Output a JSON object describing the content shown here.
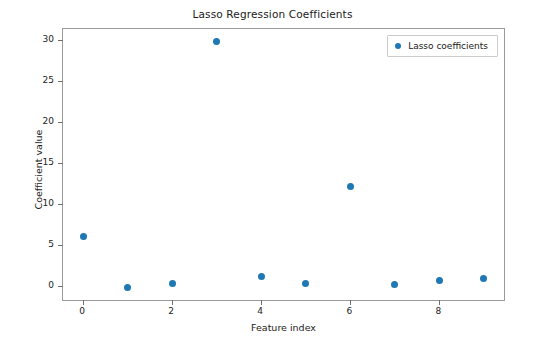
{
  "chart_data": {
    "type": "scatter",
    "title": "Lasso Regression Coefficients",
    "xlabel": "Feature index",
    "ylabel": "Coefficient value",
    "x": [
      0,
      1,
      2,
      3,
      4,
      5,
      6,
      7,
      8,
      9
    ],
    "values": [
      6.1,
      -0.2,
      0.3,
      29.9,
      1.2,
      0.35,
      12.2,
      0.25,
      0.7,
      0.9
    ],
    "series": [
      {
        "name": "Lasso coefficients",
        "values": [
          6.1,
          -0.2,
          0.3,
          29.9,
          1.2,
          0.35,
          12.2,
          0.25,
          0.7,
          0.9
        ]
      }
    ],
    "xlim": [
      -0.45,
      9.45
    ],
    "ylim": [
      -1.7,
      31.4
    ],
    "xticks": [
      0,
      2,
      4,
      6,
      8
    ],
    "yticks": [
      0,
      5,
      10,
      15,
      20,
      25,
      30
    ],
    "xtick_labels": [
      "0",
      "2",
      "4",
      "6",
      "8"
    ],
    "ytick_labels": [
      "0",
      "5",
      "10",
      "15",
      "20",
      "25",
      "30"
    ],
    "grid": false,
    "legend_position": "upper right",
    "marker_color": "#1f77b4",
    "marker": "circle"
  },
  "legend": {
    "entries": [
      {
        "label": "Lasso coefficients",
        "color": "#1f77b4",
        "marker": "circle"
      }
    ]
  },
  "colors": {
    "marker": "#1f77b4",
    "axis": "#9a9a9a",
    "text": "#1a1a1a",
    "background": "#ffffff"
  }
}
